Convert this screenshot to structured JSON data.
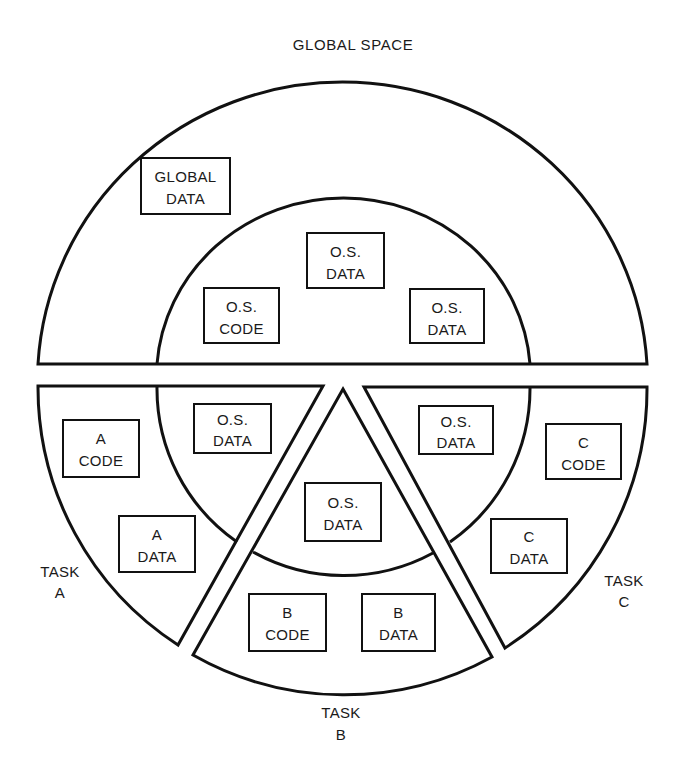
{
  "title": "GLOBAL SPACE",
  "colors": {
    "line": "#111111",
    "text": "#1a1a1a",
    "background": "#ffffff"
  },
  "global_region": {
    "name": "Global space",
    "boxes": [
      {
        "id": "global-data",
        "line1": "GLOBAL",
        "line2": "DATA"
      },
      {
        "id": "os-data-top",
        "line1": "O.S.",
        "line2": "DATA"
      },
      {
        "id": "os-code",
        "line1": "O.S.",
        "line2": "CODE"
      },
      {
        "id": "os-data-right",
        "line1": "O.S.",
        "line2": "DATA"
      }
    ]
  },
  "tasks": [
    {
      "id": "task-a",
      "label_line1": "TASK",
      "label_line2": "A",
      "boxes": [
        {
          "id": "a-code",
          "line1": "A",
          "line2": "CODE"
        },
        {
          "id": "a-os-data",
          "line1": "O.S.",
          "line2": "DATA"
        },
        {
          "id": "a-data",
          "line1": "A",
          "line2": "DATA"
        }
      ]
    },
    {
      "id": "task-b",
      "label_line1": "TASK",
      "label_line2": "B",
      "boxes": [
        {
          "id": "b-os-data",
          "line1": "O.S.",
          "line2": "DATA"
        },
        {
          "id": "b-code",
          "line1": "B",
          "line2": "CODE"
        },
        {
          "id": "b-data",
          "line1": "B",
          "line2": "DATA"
        }
      ]
    },
    {
      "id": "task-c",
      "label_line1": "TASK",
      "label_line2": "C",
      "boxes": [
        {
          "id": "c-os-data",
          "line1": "O.S.",
          "line2": "DATA"
        },
        {
          "id": "c-code",
          "line1": "C",
          "line2": "CODE"
        },
        {
          "id": "c-data",
          "line1": "C",
          "line2": "DATA"
        }
      ]
    }
  ]
}
